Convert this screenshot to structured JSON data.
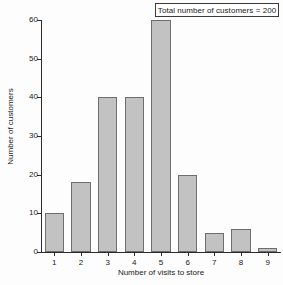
{
  "chart_data": {
    "type": "bar",
    "title": "",
    "subtitle": "",
    "xlabel": "Number of visits to store",
    "ylabel": "Number of customers",
    "categories": [
      "1",
      "2",
      "3",
      "4",
      "5",
      "6",
      "7",
      "8",
      "9"
    ],
    "values": [
      10,
      18,
      40,
      40,
      60,
      20,
      5,
      6,
      1
    ],
    "ylim": [
      0,
      60
    ],
    "y_ticks": [
      0,
      10,
      20,
      30,
      40,
      50,
      60
    ],
    "x_ticks": [
      "1",
      "2",
      "3",
      "4",
      "5",
      "6",
      "7",
      "8",
      "9"
    ],
    "grid": false,
    "legend": null,
    "annotations": [
      {
        "text": "Total number of customers = 200",
        "position": "top-right",
        "boxed": true
      }
    ],
    "series": [
      {
        "name": "Number of customers",
        "values": [
          10,
          18,
          40,
          40,
          60,
          20,
          5,
          6,
          1
        ]
      }
    ],
    "colors": {
      "bar_fill": "#c2c2c2",
      "bar_border": "#6e6e6e",
      "axis": "#2b2b2b",
      "text": "#1a1a1a",
      "background": "#fdfdfd",
      "annotation_border": "#3a3a3a"
    }
  }
}
